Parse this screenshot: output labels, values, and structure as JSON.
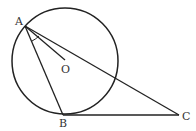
{
  "diagram": {
    "type": "geometry",
    "labels": {
      "A": "A",
      "O": "O",
      "B": "B",
      "C": "C"
    },
    "points": {
      "A": [
        25,
        26
      ],
      "O": [
        65,
        60
      ],
      "B": [
        63,
        115
      ],
      "C": [
        179,
        115
      ]
    },
    "circle": {
      "center": "O",
      "cx": 65,
      "cy": 61,
      "r": 53
    },
    "segments": [
      "AO",
      "AB",
      "AC",
      "BC"
    ],
    "colors": {
      "stroke": "#222222",
      "label": "#333333"
    }
  }
}
